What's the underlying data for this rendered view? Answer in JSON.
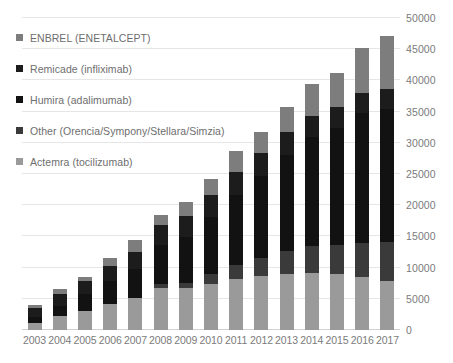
{
  "chart_data": {
    "type": "bar",
    "stacked": true,
    "title": "",
    "subtitle": "",
    "xlabel": "",
    "ylabel": "",
    "ylim": [
      0,
      50000
    ],
    "ytick_step": 5000,
    "yticks": [
      0,
      5000,
      10000,
      15000,
      20000,
      25000,
      30000,
      35000,
      40000,
      45000,
      50000
    ],
    "ytick_labels": [
      "0",
      "5000",
      "10000",
      "15000",
      "20000",
      "25000",
      "30000",
      "35000",
      "40000",
      "45000",
      "50000"
    ],
    "y_axis_position": "right",
    "grid": true,
    "grid_axis": "y",
    "legend_position": "upper-left",
    "categories": [
      "2003",
      "2004",
      "2005",
      "2006",
      "2007",
      "2008",
      "2009",
      "2010",
      "2011",
      "2012",
      "2013",
      "2014",
      "2015",
      "2016",
      "2017"
    ],
    "series": [
      {
        "name": "Actemra (tocilizumab)",
        "color": "#9a9a9a",
        "values": [
          1200,
          2200,
          3100,
          4200,
          5100,
          6700,
          6700,
          7400,
          8100,
          8600,
          8900,
          9200,
          8900,
          8500,
          7900
        ]
      },
      {
        "name": "Other (Orencia/Sympony/Stellara/Simzia)",
        "color": "#3a3a3a",
        "values": [
          0,
          0,
          0,
          0,
          0,
          600,
          900,
          1600,
          2400,
          3000,
          3700,
          4200,
          4800,
          5500,
          6200
        ]
      },
      {
        "name": "Humira (adalimumab)",
        "color": "#121212",
        "values": [
          900,
          1600,
          2600,
          3600,
          4700,
          6300,
          7300,
          9100,
          11100,
          13100,
          15500,
          17500,
          18700,
          20800,
          21400
        ]
      },
      {
        "name": "Remicade (infliximab)",
        "color": "#1c1c1c",
        "values": [
          1400,
          1900,
          2100,
          2400,
          2700,
          3200,
          3400,
          3600,
          3700,
          3600,
          3600,
          3400,
          3300,
          3200,
          3100
        ]
      },
      {
        "name": "ENBREL (ENETALCEPT)",
        "color": "#7d7d7d",
        "values": [
          500,
          800,
          700,
          1300,
          2000,
          1700,
          2200,
          2500,
          3400,
          3500,
          4000,
          5200,
          5500,
          7200,
          8600
        ]
      }
    ],
    "totals": [
      4000,
      6500,
      8500,
      11500,
      14500,
      18500,
      20500,
      24200,
      28700,
      31800,
      35700,
      39500,
      41200,
      45200,
      47200
    ]
  },
  "legend": {
    "items": [
      {
        "label": "ENBREL (ENETALCEPT)",
        "color": "#7d7d7d"
      },
      {
        "label": "Remicade (infliximab)",
        "color": "#1c1c1c"
      },
      {
        "label": "Humira (adalimumab)",
        "color": "#121212"
      },
      {
        "label": "Other (Orencia/Sympony/Stellara/Simzia)",
        "color": "#3a3a3a"
      },
      {
        "label": "Actemra (tocilizumab)",
        "color": "#9a9a9a"
      }
    ]
  },
  "colors": {
    "background": "#ffffff",
    "gridline": "#e6e6e6",
    "tick_text": "#7b7b7b",
    "legend_text": "#6e6e6e"
  }
}
